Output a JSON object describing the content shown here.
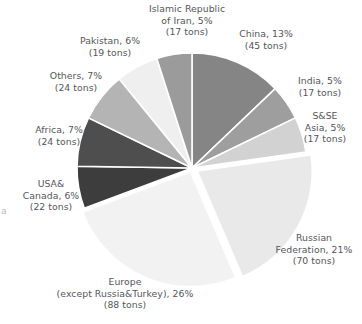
{
  "chart_data": {
    "type": "pie",
    "title": "",
    "subtitle": "",
    "xlabel": "",
    "ylabel": "",
    "legend_position": "none",
    "grid": false,
    "unit": "tons",
    "start_angle_deg": 0,
    "direction": "clockwise",
    "center": {
      "x": 192,
      "y": 168
    },
    "radius": 115,
    "categories": [
      "China",
      "India",
      "S&SE Asia",
      "Russian Federation",
      "Europe (except Russia&Turkey)",
      "USA&Canada",
      "Africa",
      "Others",
      "Pakistan",
      "Islamic Republic of Iran"
    ],
    "values": [
      13,
      5,
      5,
      21,
      26,
      6,
      7,
      7,
      6,
      5
    ],
    "tons": [
      45,
      17,
      17,
      70,
      88,
      22,
      24,
      24,
      19,
      17
    ],
    "colors": [
      "#858585",
      "#9e9e9e",
      "#d2d2d2",
      "#e9e9e9",
      "#f2f2f2",
      "#3d3d3d",
      "#4e4e4e",
      "#b4b4b4",
      "#efefef",
      "#9b9b9b"
    ],
    "slices": [
      {
        "name": "China",
        "percent": 13,
        "tons": 45,
        "color": "#858585",
        "explode": 0,
        "label_lines": [
          "China, 13%",
          "(45 tons)"
        ],
        "label_left": 223,
        "label_top": 28,
        "label_width": 86
      },
      {
        "name": "India",
        "percent": 5,
        "tons": 17,
        "color": "#9e9e9e",
        "explode": 0,
        "label_lines": [
          "India, 5%",
          "(17 tons)"
        ],
        "label_left": 281,
        "label_top": 75,
        "label_width": 78
      },
      {
        "name": "S&SE Asia",
        "percent": 5,
        "tons": 17,
        "color": "#d2d2d2",
        "explode": 0,
        "label_lines": [
          "S&SE",
          "Asia, 5%",
          "(17 tons)"
        ],
        "label_left": 290,
        "label_top": 110,
        "label_width": 70
      },
      {
        "name": "Russian Federation",
        "percent": 21,
        "tons": 70,
        "color": "#e9e9e9",
        "explode": 6,
        "label_lines": [
          "Russian",
          "Federation, 21%",
          "(70 tons)"
        ],
        "label_left": 266,
        "label_top": 232,
        "label_width": 96
      },
      {
        "name": "Europe (except Russia&Turkey)",
        "percent": 26,
        "tons": 88,
        "color": "#f2f2f2",
        "explode": 4,
        "label_lines": [
          "Europe",
          "(except Russia&Turkey), 26%",
          "(88 tons)"
        ],
        "label_left": 10,
        "label_top": 276,
        "label_width": 230
      },
      {
        "name": "USA&Canada",
        "percent": 6,
        "tons": 22,
        "color": "#3d3d3d",
        "explode": 0,
        "label_lines": [
          "USA&",
          "Canada, 6%",
          "(22 tons)"
        ],
        "label_left": 9,
        "label_top": 178,
        "label_width": 84
      },
      {
        "name": "Africa",
        "percent": 7,
        "tons": 24,
        "color": "#4e4e4e",
        "explode": 0,
        "label_lines": [
          "Africa, 7%",
          "(24 tons)"
        ],
        "label_left": 18,
        "label_top": 124,
        "label_width": 82
      },
      {
        "name": "Others",
        "percent": 7,
        "tons": 24,
        "color": "#b4b4b4",
        "explode": 0,
        "label_lines": [
          "Others, 7%",
          "(24 tons)"
        ],
        "label_left": 32,
        "label_top": 70,
        "label_width": 88
      },
      {
        "name": "Pakistan",
        "percent": 6,
        "tons": 19,
        "color": "#efefef",
        "explode": 0,
        "label_lines": [
          "Pakistan, 6%",
          "(19 tons)"
        ],
        "label_left": 62,
        "label_top": 35,
        "label_width": 96
      },
      {
        "name": "Islamic Republic of Iran",
        "percent": 5,
        "tons": 17,
        "color": "#9b9b9b",
        "explode": 0,
        "label_lines": [
          "Islamic Republic",
          "of Iran, 5%",
          "(17 tons)"
        ],
        "label_left": 133,
        "label_top": 3,
        "label_width": 108
      }
    ]
  },
  "edge_fragment": {
    "text": "a"
  }
}
